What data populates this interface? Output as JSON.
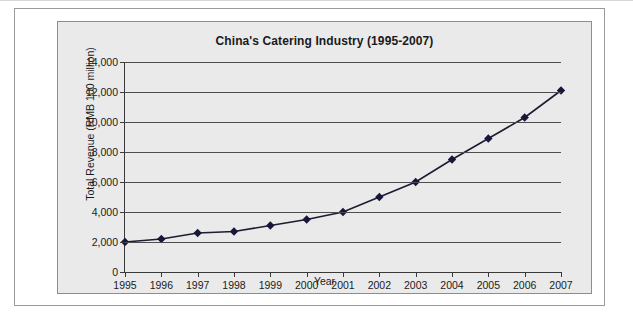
{
  "figure": {
    "background_color": "#eaeaea",
    "frame_color": "#9a9a9a"
  },
  "chart_data": {
    "type": "line",
    "title": "China's Catering Industry (1995-2007)",
    "xlabel": "Year",
    "ylabel": "Total Revenue (RMB 100 million)",
    "categories": [
      "1995",
      "1996",
      "1997",
      "1998",
      "1999",
      "2000",
      "2001",
      "2002",
      "2003",
      "2004",
      "2005",
      "2006",
      "2007"
    ],
    "x": [
      1995,
      1996,
      1997,
      1998,
      1999,
      2000,
      2001,
      2002,
      2003,
      2004,
      2005,
      2006,
      2007
    ],
    "values": [
      2000,
      2200,
      2600,
      2700,
      3100,
      3500,
      4000,
      5000,
      6000,
      7500,
      8900,
      10300,
      12100
    ],
    "series": [
      {
        "name": "Total Revenue",
        "values": [
          2000,
          2200,
          2600,
          2700,
          3100,
          3500,
          4000,
          5000,
          6000,
          7500,
          8900,
          10300,
          12100
        ]
      }
    ],
    "ylim": [
      0,
      14000
    ],
    "ytick_labels": [
      "0",
      "2,000",
      "4,000",
      "6,000",
      "8,000",
      "10,000",
      "12,000",
      "14,000"
    ],
    "yticks": [
      0,
      2000,
      4000,
      6000,
      8000,
      10000,
      12000,
      14000
    ],
    "xlim": [
      1995,
      2007
    ],
    "grid": true,
    "grid_axis": "y",
    "legend": false,
    "legend_position": "none",
    "marker": "diamond",
    "marker_color": "#17173a",
    "line_color": "#1c1c33",
    "line_width": 1.6,
    "plot_background": "#eaeaea"
  }
}
